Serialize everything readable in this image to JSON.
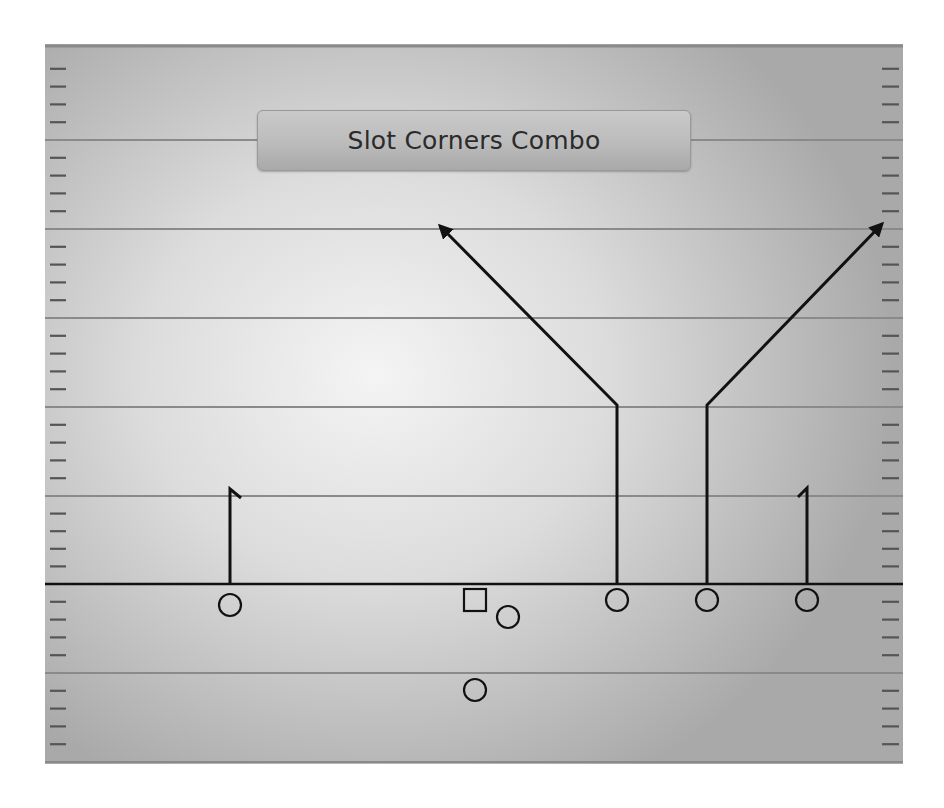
{
  "title": "Slot Corners Combo",
  "colors": {
    "route": "#111111",
    "yard_line": "#8a8a8a",
    "los": "#111111",
    "hash": "#555555"
  },
  "field": {
    "x": 45,
    "y": 44,
    "width": 858,
    "height": 720,
    "yard_lines_y": [
      140,
      229,
      318,
      407,
      496,
      673,
      762
    ],
    "line_of_scrimmage_y": 584,
    "hash_step": 17.8
  },
  "players": [
    {
      "id": "left-wr",
      "shape": "circle",
      "cx": 230,
      "cy": 605,
      "r": 11
    },
    {
      "id": "center",
      "shape": "square",
      "x": 464,
      "y": 589,
      "size": 22
    },
    {
      "id": "running-back",
      "shape": "circle",
      "cx": 508,
      "cy": 617,
      "r": 11
    },
    {
      "id": "quarterback",
      "shape": "circle",
      "cx": 475,
      "cy": 690,
      "r": 11
    },
    {
      "id": "left-slot",
      "shape": "circle",
      "cx": 617,
      "cy": 600,
      "r": 11
    },
    {
      "id": "right-slot",
      "shape": "circle",
      "cx": 707,
      "cy": 600,
      "r": 11
    },
    {
      "id": "right-wr",
      "shape": "circle",
      "cx": 807,
      "cy": 600,
      "r": 11
    }
  ],
  "routes": [
    {
      "id": "left-wr-hitch",
      "points": [
        [
          230,
          584
        ],
        [
          230,
          489
        ],
        [
          241,
          498
        ]
      ],
      "arrow": false
    },
    {
      "id": "left-slot-corner",
      "points": [
        [
          617,
          584
        ],
        [
          617,
          405
        ],
        [
          440,
          226
        ]
      ],
      "arrow": true
    },
    {
      "id": "right-slot-corner",
      "points": [
        [
          707,
          584
        ],
        [
          707,
          405
        ],
        [
          882,
          224
        ]
      ],
      "arrow": true
    },
    {
      "id": "right-wr-hitch",
      "points": [
        [
          807,
          584
        ],
        [
          807,
          488
        ],
        [
          798,
          497
        ]
      ],
      "arrow": false
    }
  ]
}
